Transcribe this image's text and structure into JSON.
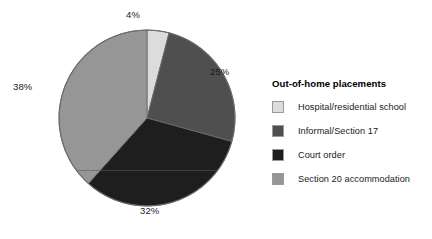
{
  "chart_data": {
    "type": "pie",
    "title": "",
    "legend_title": "Out-of-home placements",
    "legend_position": "right",
    "grid": false,
    "categories": [
      "Hospital/residential school",
      "Informal/Section 17",
      "Court order",
      "Section 20 accommodation"
    ],
    "values": [
      4,
      25,
      32,
      38
    ],
    "value_labels": [
      "4%",
      "25%",
      "32%",
      "38%"
    ],
    "colors": [
      "#dcdcdc",
      "#4f4f4f",
      "#1e1e1e",
      "#969696"
    ],
    "slice_order": "clockwise from top",
    "units": "percent",
    "slices": [
      {
        "label": "Hospital/residential school",
        "value": 4,
        "display": "4%",
        "color": "#dcdcdc"
      },
      {
        "label": "Informal/Section 17",
        "value": 25,
        "display": "25%",
        "color": "#4f4f4f"
      },
      {
        "label": "Court order",
        "value": 32,
        "display": "32%",
        "color": "#1e1e1e"
      },
      {
        "label": "Section 20 accommodation",
        "value": 38,
        "display": "38%",
        "color": "#969696"
      }
    ]
  },
  "legend": {
    "title": "Out-of-home placements",
    "items": [
      {
        "label": "Hospital/residential school",
        "color": "#dcdcdc"
      },
      {
        "label": "Informal/Section 17",
        "color": "#4f4f4f"
      },
      {
        "label": "Court order",
        "color": "#1e1e1e"
      },
      {
        "label": "Section 20 accommodation",
        "color": "#969696"
      }
    ]
  },
  "pie": {
    "center_x": 147,
    "center_y": 118,
    "radius": 88,
    "outline_color": "#6b6b6b"
  }
}
